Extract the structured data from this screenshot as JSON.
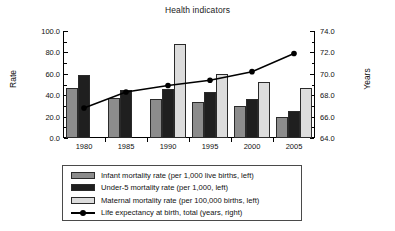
{
  "chart_data": {
    "type": "bar",
    "title": "Health indicators",
    "xlabel": "",
    "ylabel": "Rate",
    "ylabel_right": "Years",
    "categories": [
      "1980",
      "1985",
      "1990",
      "1995",
      "2000",
      "2005"
    ],
    "ylim": [
      0.0,
      100.0
    ],
    "ylim_right": [
      64.0,
      74.0
    ],
    "ytick_labels": [
      "0.0",
      "20.0",
      "40.0",
      "60.0",
      "80.0",
      "100.0"
    ],
    "ytick_values": [
      0.0,
      20.0,
      40.0,
      60.0,
      80.0,
      100.0
    ],
    "ytick_right_labels": [
      "64.0",
      "66.0",
      "68.0",
      "70.0",
      "72.0",
      "74.0"
    ],
    "ytick_right_values": [
      64.0,
      66.0,
      68.0,
      70.0,
      72.0,
      74.0
    ],
    "grid": false,
    "legend_position": "below",
    "series": [
      {
        "name": "Infant mortality rate (per 1,000 live births, left)",
        "key": "infant",
        "axis": "left",
        "kind": "bar",
        "color": "#8c8c8c",
        "values": [
          47,
          37,
          36,
          34,
          30,
          20
        ]
      },
      {
        "name": "Under-5 mortality rate (per 1,000, left)",
        "key": "under5",
        "axis": "left",
        "kind": "bar",
        "color": "#1f1f1f",
        "values": [
          59,
          45,
          46,
          43,
          36,
          25
        ]
      },
      {
        "name": "Maternal mortality rate (per 100,000 births, left)",
        "key": "maternal",
        "axis": "left",
        "kind": "bar",
        "color": "#dcdcdc",
        "values": [
          null,
          null,
          88,
          60,
          52,
          47
        ]
      },
      {
        "name": "Life expectancy at birth, total (years, right)",
        "key": "life_expectancy",
        "axis": "right",
        "kind": "line",
        "color": "#000000",
        "values": [
          66.8,
          68.3,
          68.9,
          69.4,
          70.2,
          71.9
        ]
      }
    ]
  },
  "legend": {
    "items": [
      {
        "label": "Infant mortality rate (per 1,000 live births, left)",
        "swatch": "infant"
      },
      {
        "label": "Under-5 mortality rate (per 1,000, left)",
        "swatch": "under5"
      },
      {
        "label": "Maternal mortality rate (per 100,000 births, left)",
        "swatch": "maternal"
      },
      {
        "label": "Life expectancy at birth, total (years, right)",
        "swatch": "line"
      }
    ]
  }
}
